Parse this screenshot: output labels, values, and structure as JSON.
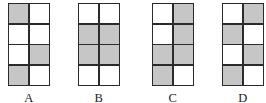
{
  "figure": {
    "type": "multiple-choice-grid-figure",
    "grid": {
      "rows": 4,
      "columns": 2
    },
    "colors": {
      "shaded": "#c6c6c6",
      "empty": "#ffffff",
      "border": "#2b2b2b",
      "background": "#ffffff",
      "label": "#1a1a1a"
    },
    "options": [
      {
        "label": "A",
        "cells": [
          [
            "shaded",
            "empty"
          ],
          [
            "empty",
            "empty"
          ],
          [
            "empty",
            "shaded"
          ],
          [
            "shaded",
            "empty"
          ]
        ]
      },
      {
        "label": "B",
        "cells": [
          [
            "empty",
            "empty"
          ],
          [
            "shaded",
            "shaded"
          ],
          [
            "shaded",
            "shaded"
          ],
          [
            "empty",
            "empty"
          ]
        ]
      },
      {
        "label": "C",
        "cells": [
          [
            "empty",
            "shaded"
          ],
          [
            "empty",
            "shaded"
          ],
          [
            "shaded",
            "shaded"
          ],
          [
            "shaded",
            "empty"
          ]
        ]
      },
      {
        "label": "D",
        "cells": [
          [
            "empty",
            "shaded"
          ],
          [
            "shaded",
            "empty"
          ],
          [
            "empty",
            "shaded"
          ],
          [
            "shaded",
            "empty"
          ]
        ]
      }
    ]
  }
}
